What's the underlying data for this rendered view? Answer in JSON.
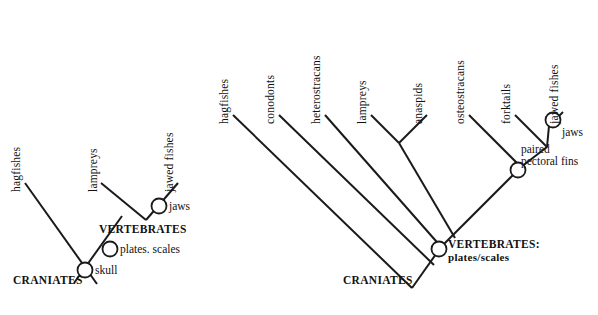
{
  "figure": {
    "type": "cladogram-pair",
    "background_color": "#ffffff",
    "line_color": "#1a1a1a"
  },
  "left_tree": {
    "name": "simplified-craniate-cladogram",
    "tips": [
      {
        "id": "hagfishes",
        "label": "hagfishes",
        "x": 22,
        "y": 176
      },
      {
        "id": "lampreys",
        "label": "lampreys",
        "x": 99,
        "y": 176
      },
      {
        "id": "jawed-fishes",
        "label": "jawed fishes",
        "x": 175,
        "y": 176
      }
    ],
    "nodes": [
      {
        "id": "jaws",
        "label": "jaws",
        "x": 155,
        "y": 209,
        "label_x": 165,
        "label_y": 204
      },
      {
        "id": "plates-scales",
        "label": "plates. scales",
        "x": 107,
        "y": 250,
        "label_x": 117,
        "label_y": 245
      },
      {
        "id": "skull",
        "label": "skull",
        "x": 84,
        "y": 271,
        "label_x": 94,
        "label_y": 266
      }
    ],
    "clade_labels": [
      {
        "id": "vertebrates",
        "label": "VERTEBRATES",
        "x": 99,
        "y": 228
      },
      {
        "id": "craniates",
        "label": "CRANIATES",
        "x": 13,
        "y": 281
      }
    ]
  },
  "right_tree": {
    "name": "detailed-craniate-cladogram",
    "tips": [
      {
        "id": "hagfishes",
        "label": "hagfishes",
        "x": 230,
        "y": 113
      },
      {
        "id": "conodonts",
        "label": "conodonts",
        "x": 276,
        "y": 113
      },
      {
        "id": "heterostracans",
        "label": "heterostracans",
        "x": 322,
        "y": 113
      },
      {
        "id": "lampreys",
        "label": "lampreys",
        "x": 374,
        "y": 113
      },
      {
        "id": "anaspids",
        "label": "anaspids",
        "x": 420,
        "y": 113
      },
      {
        "id": "osteostracans",
        "label": "osteostracans",
        "x": 466,
        "y": 113
      },
      {
        "id": "forktails",
        "label": "forktails",
        "x": 512,
        "y": 113
      },
      {
        "id": "jawed-fishes",
        "label": "jawed fishes",
        "x": 560,
        "y": 113
      }
    ],
    "nodes": [
      {
        "id": "jaws",
        "label": "jaws",
        "x": 554,
        "y": 122,
        "label_x": 562,
        "label_y": 130
      },
      {
        "id": "paired-pectoral-fins",
        "label": "paired\npectoral fins",
        "line1": "paired",
        "line2": "pectoral fins",
        "x": 517,
        "y": 162,
        "label_x": 521,
        "label_y": 148
      },
      {
        "id": "vertebrates",
        "label": "VERTEBRATES:",
        "x": 438,
        "y": 243,
        "label_x": 447,
        "label_y": 235
      }
    ],
    "clade_labels": [
      {
        "id": "vertebrates",
        "label": "VERTEBRATES:",
        "sub": "plates/scales",
        "x": 447,
        "y": 235
      },
      {
        "id": "craniates",
        "label": "CRANIATES",
        "x": 343,
        "y": 281
      }
    ]
  }
}
